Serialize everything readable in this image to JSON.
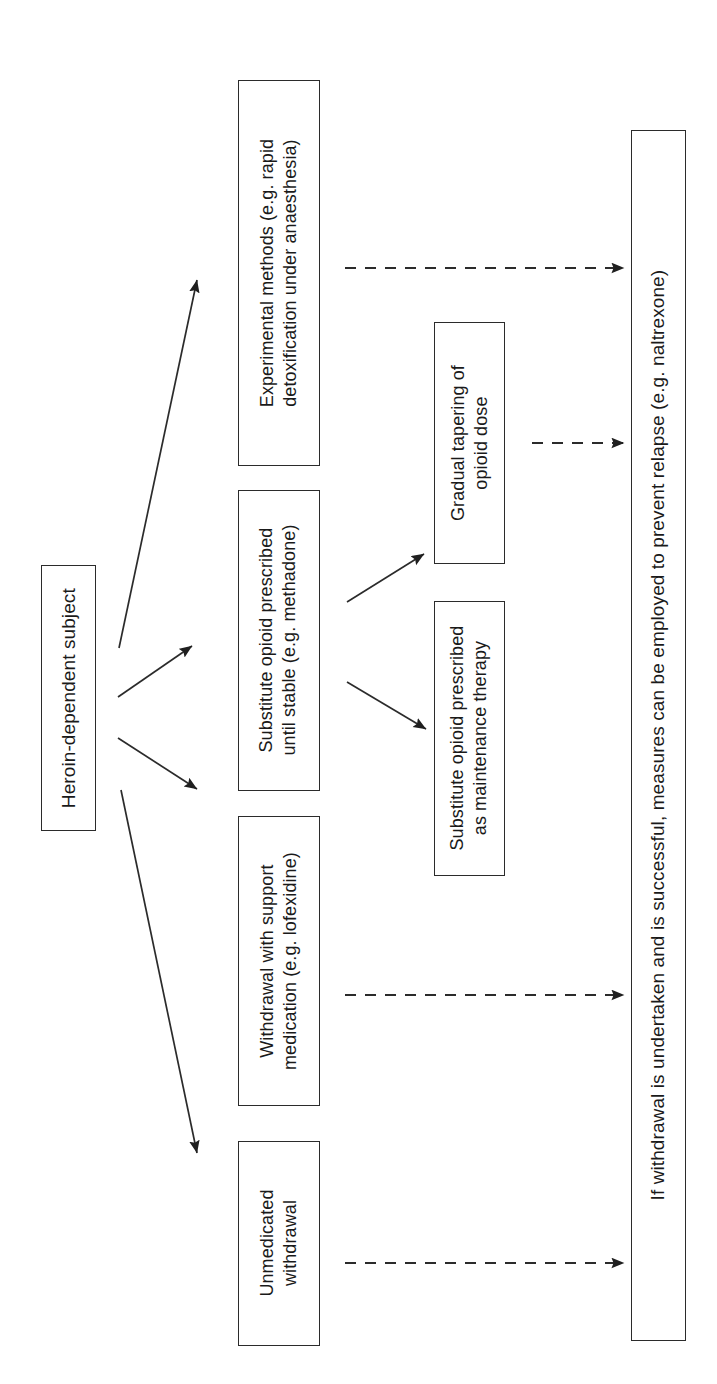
{
  "diagram": {
    "orientation": "rotated-90",
    "text_color": "#1a1a1a",
    "line_color": "#2b2b2b",
    "background": "#ffffff"
  },
  "nodes": {
    "source": {
      "label": "Heroin-dependent subject",
      "font_size": "19px"
    },
    "experimental": {
      "label": "Experimental methods (e.g. rapid\ndetoxification under anaesthesia)",
      "font_size": "18px"
    },
    "substitute_stable": {
      "label": "Substitute opioid prescribed\nuntil stable (e.g. methadone)",
      "font_size": "18px"
    },
    "withdrawal_support": {
      "label": "Withdrawal with support\nmedication (e.g. lofexidine)",
      "font_size": "18px"
    },
    "unmedicated": {
      "label": "Unmedicated\nwithdrawal",
      "font_size": "18px"
    },
    "tapering": {
      "label": "Gradual tapering of\nopioid dose",
      "font_size": "18px"
    },
    "maintenance": {
      "label": "Substitute opioid prescribed\nas maintenance therapy",
      "font_size": "18px"
    },
    "outcome": {
      "label": "If withdrawal is undertaken and is successful, measures can be employed to prevent relapse (e.g. naltrexone)",
      "font_size": "19px"
    }
  },
  "edges": {
    "solid": [
      {
        "name": "source-to-experimental",
        "from": "source",
        "to": "experimental"
      },
      {
        "name": "source-to-substitute-stable",
        "from": "source",
        "to": "substitute_stable"
      },
      {
        "name": "source-to-withdrawal-support",
        "from": "source",
        "to": "withdrawal_support"
      },
      {
        "name": "source-to-unmedicated",
        "from": "source",
        "to": "unmedicated"
      },
      {
        "name": "substitute-to-tapering",
        "from": "substitute_stable",
        "to": "tapering"
      },
      {
        "name": "substitute-to-maintenance",
        "from": "substitute_stable",
        "to": "maintenance"
      }
    ],
    "dashed": [
      {
        "name": "experimental-to-outcome",
        "from": "experimental",
        "to": "outcome"
      },
      {
        "name": "tapering-to-outcome",
        "from": "tapering",
        "to": "outcome"
      },
      {
        "name": "withdrawal-support-to-outcome",
        "from": "withdrawal_support",
        "to": "outcome"
      },
      {
        "name": "unmedicated-to-outcome",
        "from": "unmedicated",
        "to": "outcome"
      }
    ]
  }
}
